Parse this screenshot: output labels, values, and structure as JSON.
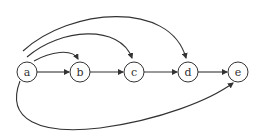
{
  "diagram": {
    "type": "directed-graph",
    "nodes": [
      {
        "id": "a",
        "label": "a",
        "cx": 27,
        "cy": 72
      },
      {
        "id": "b",
        "label": "b",
        "cx": 80,
        "cy": 72
      },
      {
        "id": "c",
        "label": "c",
        "cx": 134,
        "cy": 72
      },
      {
        "id": "d",
        "label": "d",
        "cx": 188,
        "cy": 72
      },
      {
        "id": "e",
        "label": "e",
        "cx": 238,
        "cy": 72
      }
    ],
    "edges": [
      {
        "from": "a",
        "to": "b",
        "style": "straight"
      },
      {
        "from": "b",
        "to": "c",
        "style": "straight"
      },
      {
        "from": "c",
        "to": "d",
        "style": "straight"
      },
      {
        "from": "d",
        "to": "e",
        "style": "straight"
      },
      {
        "from": "a",
        "to": "b",
        "style": "arc-above"
      },
      {
        "from": "a",
        "to": "c",
        "style": "arc-above"
      },
      {
        "from": "a",
        "to": "d",
        "style": "arc-above"
      },
      {
        "from": "a",
        "to": "e",
        "style": "arc-below"
      }
    ],
    "colors": {
      "stroke": "#333333",
      "fill": "#ffffff"
    }
  }
}
